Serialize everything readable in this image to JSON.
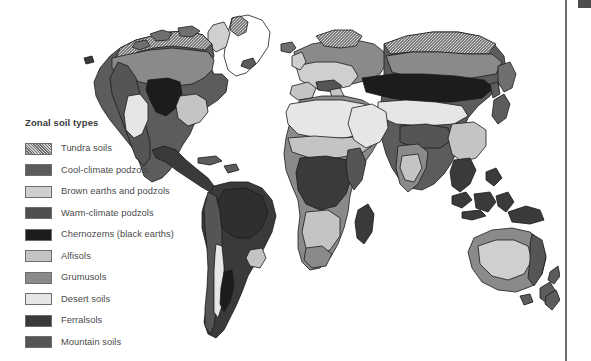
{
  "figure": {
    "name": "world-zonal-soil-types-map",
    "background_color": "#ffffff"
  },
  "legend": {
    "title": "Zonal soil types",
    "items": [
      {
        "label": "Tundra soils",
        "color": "#6f6f6f",
        "pattern": "stipple"
      },
      {
        "label": "Cool-climate podzols",
        "color": "#5c5c5c",
        "pattern": "solid"
      },
      {
        "label": "Brown earths and podzols",
        "color": "#cfcfcf",
        "pattern": "solid"
      },
      {
        "label": "Warm-climate podzols",
        "color": "#4f4f4f",
        "pattern": "solid"
      },
      {
        "label": "Chernozems (black earths)",
        "color": "#1c1c1c",
        "pattern": "solid"
      },
      {
        "label": "Alfisols",
        "color": "#c4c4c4",
        "pattern": "solid"
      },
      {
        "label": "Grumusols",
        "color": "#8a8a8a",
        "pattern": "solid"
      },
      {
        "label": "Desert soils",
        "color": "#e6e6e6",
        "pattern": "solid"
      },
      {
        "label": "Ferralsols",
        "color": "#3a3a3a",
        "pattern": "solid"
      },
      {
        "label": "Mountain soils",
        "color": "#555555",
        "pattern": "solid"
      }
    ]
  },
  "right_rail": {
    "divider_color": "#6e6e6e",
    "corner_mark_color": "#4d4d4d"
  },
  "map": {
    "outline_color": "#1a1a1a",
    "ocean_color": "#ffffff",
    "regions": [
      "north-america",
      "greenland",
      "south-america",
      "europe",
      "africa",
      "asia",
      "australia",
      "indonesia",
      "new-zealand",
      "japan",
      "madagascar"
    ]
  }
}
